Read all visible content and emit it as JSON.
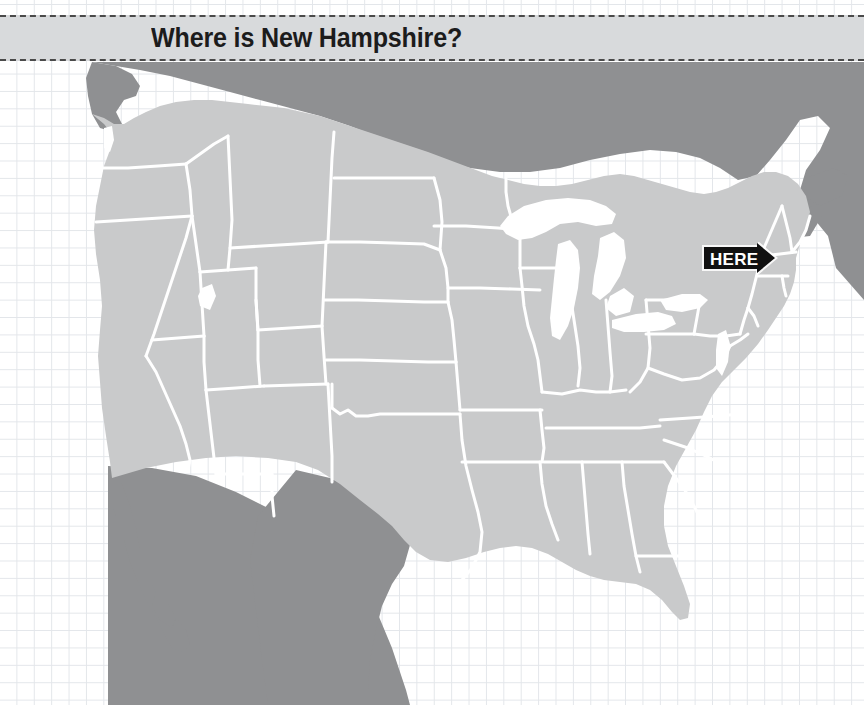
{
  "page": {
    "width": 864,
    "height": 705,
    "background_color": "#ffffff"
  },
  "banner": {
    "title": "Where is New Hampshire?",
    "background_color": "#d8dadc",
    "border_style": "dashed",
    "border_color": "#4a4a4a",
    "text_color": "#1c1c1c"
  },
  "map": {
    "name": "united-states-locator-map",
    "projection_note": "contiguous United States with Canada and Mexico",
    "colors": {
      "us_states_fill": "#c9cacb",
      "us_state_border": "#ffffff",
      "neighbor_country_fill": "#8f9092",
      "water_fill": "#ffffff",
      "grid_line": "#e3e6ea",
      "ocean_fill": "#ffffff"
    },
    "regions": [
      {
        "name": "Canada",
        "fill": "neighbor"
      },
      {
        "name": "Mexico",
        "fill": "neighbor"
      },
      {
        "name": "United States",
        "fill": "states"
      },
      {
        "name": "Great Lakes",
        "fill": "water"
      },
      {
        "name": "Great Salt Lake",
        "fill": "water"
      }
    ]
  },
  "marker": {
    "label": "HERE",
    "shape": "right-pointing-arrow",
    "fill_color": "#111111",
    "text_color": "#ffffff",
    "points_to": "New Hampshire",
    "x": 702,
    "y": 242,
    "width": 76,
    "height": 32
  }
}
